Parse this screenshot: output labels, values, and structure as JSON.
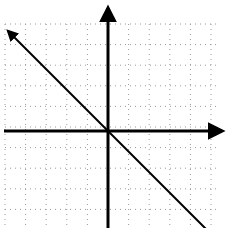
{
  "chart_data": {
    "type": "line",
    "title": "",
    "xlabel": "",
    "ylabel": "",
    "grid": true,
    "grid_style": "dotted",
    "xlim": [
      -5,
      5
    ],
    "ylim": [
      -5,
      5
    ],
    "series": [
      {
        "name": "y = -x",
        "x": [
          -5,
          5
        ],
        "values": [
          5,
          -5
        ],
        "arrows": "both-ends"
      }
    ],
    "axes": {
      "x_arrow": "positive-end",
      "y_arrow": "positive-end"
    }
  },
  "colors": {
    "background": "#ffffff",
    "grid": "#9a9a9a",
    "axis": "#000000",
    "line": "#000000"
  }
}
